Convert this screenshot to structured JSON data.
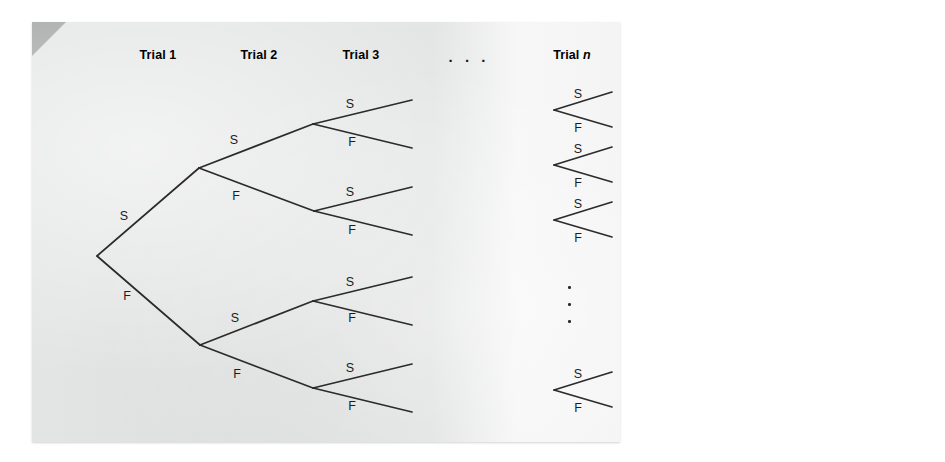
{
  "figure": {
    "background_color": "#ffffff",
    "panel_color": "#e3e4e4",
    "line_color": "#2b2b2b"
  },
  "headers": [
    {
      "name": "trial-1",
      "text": "Trial 1",
      "italic_suffix": "",
      "x": 158,
      "y": 48
    },
    {
      "name": "trial-2",
      "text": "Trial 2",
      "italic_suffix": "",
      "x": 259,
      "y": 48
    },
    {
      "name": "trial-3",
      "text": "Trial 3",
      "italic_suffix": "",
      "x": 361,
      "y": 48
    },
    {
      "name": "trial-n",
      "text": "Trial ",
      "italic_suffix": "n",
      "x": 572,
      "y": 48
    }
  ],
  "ellipsis_horizontal": {
    "text": ". . .",
    "x": 469,
    "y": 48
  },
  "ellipsis_vertical": {
    "dots": 3,
    "x": 568,
    "y_values": [
      286,
      303,
      320
    ]
  },
  "labels": {
    "success": "S",
    "failure": "F"
  },
  "branch_labels": [
    {
      "label": "S",
      "x": 124,
      "y": 216,
      "trial": 1
    },
    {
      "label": "F",
      "x": 127,
      "y": 296,
      "trial": 1
    },
    {
      "label": "S",
      "x": 234,
      "y": 140,
      "trial": 2
    },
    {
      "label": "F",
      "x": 236,
      "y": 196,
      "trial": 2
    },
    {
      "label": "S",
      "x": 235,
      "y": 318,
      "trial": 2
    },
    {
      "label": "F",
      "x": 237,
      "y": 374,
      "trial": 2
    },
    {
      "label": "S",
      "x": 350,
      "y": 104,
      "trial": 3
    },
    {
      "label": "F",
      "x": 352,
      "y": 142,
      "trial": 3
    },
    {
      "label": "S",
      "x": 350,
      "y": 192,
      "trial": 3
    },
    {
      "label": "F",
      "x": 352,
      "y": 230,
      "trial": 3
    },
    {
      "label": "S",
      "x": 350,
      "y": 282,
      "trial": 3
    },
    {
      "label": "F",
      "x": 352,
      "y": 318,
      "trial": 3
    },
    {
      "label": "S",
      "x": 350,
      "y": 368,
      "trial": 3
    },
    {
      "label": "F",
      "x": 352,
      "y": 406,
      "trial": 3
    },
    {
      "label": "S",
      "x": 578,
      "y": 94,
      "trial": "n"
    },
    {
      "label": "F",
      "x": 578,
      "y": 128,
      "trial": "n"
    },
    {
      "label": "S",
      "x": 578,
      "y": 149,
      "trial": "n"
    },
    {
      "label": "F",
      "x": 578,
      "y": 183,
      "trial": "n"
    },
    {
      "label": "S",
      "x": 578,
      "y": 204,
      "trial": "n"
    },
    {
      "label": "F",
      "x": 578,
      "y": 238,
      "trial": "n"
    },
    {
      "label": "S",
      "x": 578,
      "y": 374,
      "trial": "n"
    },
    {
      "label": "F",
      "x": 578,
      "y": 408,
      "trial": "n"
    }
  ],
  "tree": {
    "root": {
      "x": 97,
      "y": 256
    },
    "trial1_branches": [
      {
        "outcome": "S",
        "from": [
          97,
          256
        ],
        "to": [
          199,
          168
        ]
      },
      {
        "outcome": "F",
        "from": [
          97,
          256
        ],
        "to": [
          200,
          345
        ]
      }
    ],
    "trial2_branches": [
      {
        "outcome": "S",
        "from": [
          199,
          168
        ],
        "to": [
          313,
          124
        ]
      },
      {
        "outcome": "F",
        "from": [
          199,
          168
        ],
        "to": [
          314,
          211
        ]
      },
      {
        "outcome": "S",
        "from": [
          200,
          345
        ],
        "to": [
          313,
          301
        ]
      },
      {
        "outcome": "F",
        "from": [
          200,
          345
        ],
        "to": [
          313,
          388
        ]
      }
    ],
    "trial3_branches": [
      {
        "outcome": "S",
        "from": [
          313,
          124
        ],
        "to": [
          412,
          100
        ]
      },
      {
        "outcome": "F",
        "from": [
          313,
          124
        ],
        "to": [
          412,
          148
        ]
      },
      {
        "outcome": "S",
        "from": [
          314,
          211
        ],
        "to": [
          412,
          187
        ]
      },
      {
        "outcome": "F",
        "from": [
          314,
          211
        ],
        "to": [
          412,
          235
        ]
      },
      {
        "outcome": "S",
        "from": [
          313,
          301
        ],
        "to": [
          412,
          277
        ]
      },
      {
        "outcome": "F",
        "from": [
          313,
          301
        ],
        "to": [
          412,
          325
        ]
      },
      {
        "outcome": "S",
        "from": [
          313,
          388
        ],
        "to": [
          412,
          364
        ]
      },
      {
        "outcome": "F",
        "from": [
          313,
          388
        ],
        "to": [
          412,
          412
        ]
      }
    ],
    "trialn_forks": [
      {
        "node": [
          554,
          110
        ],
        "s_end": [
          612,
          92
        ],
        "f_end": [
          612,
          127
        ]
      },
      {
        "node": [
          554,
          165
        ],
        "s_end": [
          612,
          147
        ],
        "f_end": [
          612,
          182
        ]
      },
      {
        "node": [
          554,
          220
        ],
        "s_end": [
          612,
          202
        ],
        "f_end": [
          612,
          237
        ]
      },
      {
        "node": [
          554,
          390
        ],
        "s_end": [
          612,
          372
        ],
        "f_end": [
          612,
          407
        ]
      }
    ]
  }
}
